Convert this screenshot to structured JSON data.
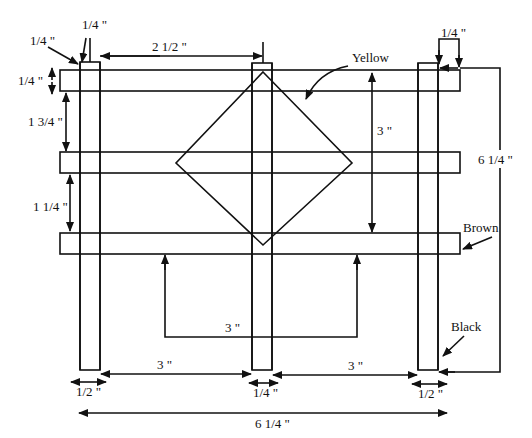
{
  "diagram": {
    "colors": {
      "line": "#111111",
      "background": "#ffffff"
    },
    "labels": {
      "top_post_width": "1/4 \"",
      "top_left_corner": "1/4 \"",
      "post_gap_top": "2 1/2 \"",
      "rail_thickness_left": "1/4 \"",
      "rail_gap_1": "1 3/4 \"",
      "rail_gap_2": "1 1/4 \"",
      "diamond_height": "3 \"",
      "right_post_offset": "1/4 \"",
      "total_height": "6 1/4 \"",
      "color_yellow": "Yellow",
      "color_brown": "Brown",
      "color_black": "Black",
      "diamond_width": "3 \"",
      "bottom_gap_left": "3 \"",
      "bottom_gap_right": "3 \"",
      "left_post_width": "1/2 \"",
      "middle_post_width": "1/4 \"",
      "right_post_width": "1/2 \"",
      "total_width": "6 1/4 \""
    },
    "parts": {
      "posts": [
        "left-post",
        "middle-post",
        "right-post"
      ],
      "rails": [
        "top-rail",
        "middle-rail",
        "bottom-rail"
      ],
      "diamond": "yellow-diamond"
    }
  }
}
